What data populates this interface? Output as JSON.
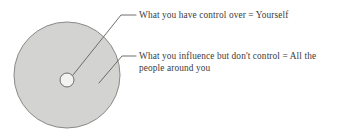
{
  "diagram": {
    "type": "concentric-circle-callout",
    "background_color": "#ffffff",
    "outer_circle": {
      "label": "sphere-of-influence",
      "fill_color": "#d3d3d1",
      "stroke_color": "#8a8a88",
      "center_x": 67,
      "center_y": 75,
      "radius": 53
    },
    "inner_circle": {
      "label": "sphere-of-control",
      "fill_color": "#f2f2f0",
      "stroke_color": "#6e6e6c",
      "center_x": 67,
      "center_y": 80,
      "radius": 7
    },
    "leader_line_color": "#5d5d5b",
    "callouts": [
      {
        "id": "control",
        "text": "What you have control over = Yourself",
        "target": "inner_circle"
      },
      {
        "id": "influence",
        "text": "What you influence but don't control = All the people around you",
        "target": "outer_circle"
      }
    ]
  }
}
